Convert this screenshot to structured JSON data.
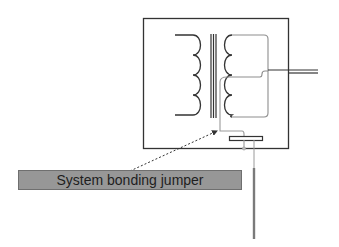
{
  "diagram": {
    "components": [
      {
        "name": "enclosure",
        "type": "rectangle"
      },
      {
        "name": "primary-winding",
        "type": "coil",
        "turns": 4
      },
      {
        "name": "transformer-core",
        "type": "parallel-lines",
        "count": 3
      },
      {
        "name": "secondary-winding",
        "type": "coil",
        "turns": 4,
        "center_tap": true
      },
      {
        "name": "output-conductors",
        "type": "parallel-lines",
        "count": 2
      },
      {
        "name": "bonding-bar",
        "type": "rectangle"
      },
      {
        "name": "grounding-electrode",
        "type": "rod"
      }
    ],
    "callout": {
      "label": "System bonding jumper",
      "arrow_style": "dotted"
    },
    "colors": {
      "line": "#333333",
      "grey_wire": "#9a9a9a",
      "label_fill": "#979797",
      "rod": "#7a7a7a"
    }
  }
}
